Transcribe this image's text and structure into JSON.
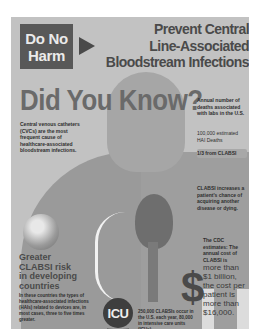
{
  "header": {
    "badge_line1": "Do No",
    "badge_line2": "Harm",
    "title_lines": [
      "Prevent Central",
      "Line-Associated",
      "Bloodstream Infections"
    ]
  },
  "main": {
    "did_you_know": "Did You Know?",
    "cvc_text": "Central venous catheters (CVCs) are the most frequent cause of healthcare-associated bloodstream infections."
  },
  "sidebar": {
    "annual_label": "Annual number of deaths associated with labs in the U.S.",
    "deaths_stat": "100,000 estimated HAI Deaths",
    "clabsi_fraction": "1/3 from CLABSI",
    "risk_text": "CLABSI increases a patient's chance of acquiring another disease or dying.",
    "cdc_text": "The CDC estimates: The annual cost of CLABSI is",
    "cost_text": "more than $1 billion, the cost per patient is more than $16,000."
  },
  "global": {
    "greater_lines": [
      "Greater",
      "CLABSI risk",
      "in developing",
      "countries"
    ],
    "detail": "In these countries the types of healthcare-associated infections (HAIs) related to devices are, in most cases, three to five times greater."
  },
  "icu": {
    "label": "ICU",
    "text": "250,000 CLABSIs occur in the U.S. each year, 80,000 in intensive care units (ICUs)."
  },
  "icons": {
    "dollar": "$"
  }
}
